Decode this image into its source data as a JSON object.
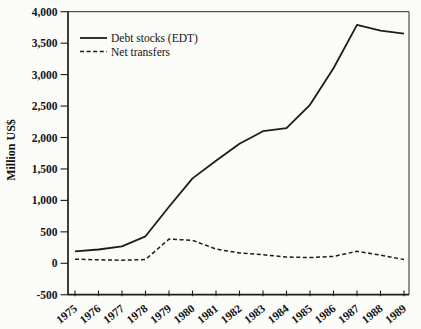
{
  "figure": {
    "background": "#fbfbf8",
    "ink_color": "#1c1c1c"
  },
  "chart_data": {
    "type": "line",
    "title": "",
    "xlabel": "",
    "ylabel": "Million US$",
    "x": [
      1975,
      1976,
      1977,
      1978,
      1979,
      1980,
      1981,
      1982,
      1983,
      1984,
      1985,
      1986,
      1987,
      1988,
      1989
    ],
    "x_tick_labels": [
      "1975",
      "1976",
      "1977",
      "1978",
      "1979",
      "1980",
      "1981",
      "1982",
      "1983",
      "1984",
      "1985",
      "1986",
      "1987",
      "1988",
      "1989"
    ],
    "series": [
      {
        "name": "Debt stocks (EDT)",
        "style": "solid",
        "values": [
          190,
          220,
          270,
          430,
          900,
          1350,
          1630,
          1900,
          2100,
          2150,
          2520,
          3100,
          3790,
          3700,
          3650
        ]
      },
      {
        "name": "Net transfers",
        "style": "dashed",
        "values": [
          65,
          55,
          50,
          60,
          385,
          365,
          225,
          165,
          135,
          100,
          90,
          110,
          190,
          130,
          60
        ]
      }
    ],
    "ylim": [
      -500,
      4000
    ],
    "ytick_step": 500,
    "ytick_labels": [
      "-500",
      "0",
      "500",
      "1,000",
      "1,500",
      "2,000",
      "2,500",
      "3,000",
      "3,500",
      "4,000"
    ],
    "grid": false,
    "legend_position": "top-left"
  }
}
